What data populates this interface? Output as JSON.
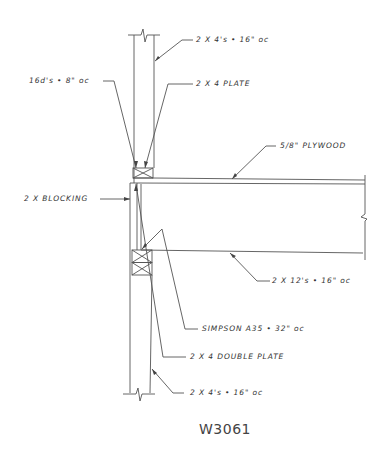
{
  "drawing": {
    "id": "W3061",
    "stroke_color": "#555555",
    "text_color": "#333333"
  },
  "labels": {
    "studs_top": "2 X 4's • 16\" oc",
    "nails": "16d's • 8\" oc",
    "plate": "2 X 4 PLATE",
    "plywood": "5/8\" PLYWOOD",
    "blocking": "2 X BLOCKING",
    "joists": "2 X 12's • 16\" oc",
    "connector": "SIMPSON A35 • 32\" oc",
    "double_plate": "2 X 4 DOUBLE PLATE",
    "studs_bottom": "2 X 4's • 16\" oc"
  }
}
